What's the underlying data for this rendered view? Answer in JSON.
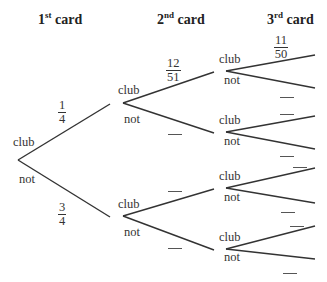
{
  "headers": [
    {
      "base": "1",
      "sup": "st",
      "text": " card"
    },
    {
      "base": "2",
      "sup": "nd",
      "text": " card"
    },
    {
      "base": "3",
      "sup": "rd",
      "text": " card"
    }
  ],
  "labels": {
    "club": "club",
    "not": "not"
  },
  "fractions": {
    "first_club": {
      "num": "1",
      "den": "4"
    },
    "first_not": {
      "num": "3",
      "den": "4"
    },
    "second_club_given_club": {
      "num": "12",
      "den": "51"
    },
    "third_club_given_club_club": {
      "num": "11",
      "den": "50"
    }
  },
  "tree": {
    "root": {
      "x": 18,
      "y": 160
    },
    "level1": [
      {
        "x": 110,
        "y": 104,
        "branch": "club"
      },
      {
        "x": 110,
        "y": 217,
        "branch": "not"
      }
    ],
    "level2_vertices": [
      {
        "x": 123,
        "y": 103
      },
      {
        "x": 123,
        "y": 216
      }
    ],
    "level2_ends": [
      {
        "x": 214,
        "y": 72
      },
      {
        "x": 214,
        "y": 133
      },
      {
        "x": 214,
        "y": 189
      },
      {
        "x": 214,
        "y": 250
      }
    ],
    "level3_vertices": [
      {
        "x": 226,
        "y": 71
      },
      {
        "x": 226,
        "y": 132
      },
      {
        "x": 226,
        "y": 188
      },
      {
        "x": 226,
        "y": 249
      }
    ],
    "level3_ends": [
      55,
      88,
      116,
      149,
      168,
      203,
      226,
      259
    ]
  },
  "colors": {
    "line": "#333333",
    "text": "#333333"
  }
}
